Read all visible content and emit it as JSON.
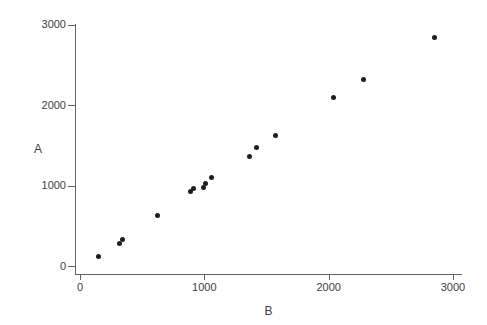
{
  "figure": {
    "background_color": "#ffffff",
    "axis_color": "#636363",
    "text_color": "#3d3d3d"
  },
  "chart_data": {
    "type": "scatter",
    "title": "",
    "xlabel": "B",
    "ylabel": "A",
    "xlim": [
      0,
      3000
    ],
    "ylim": [
      0,
      3000
    ],
    "x_ticks": [
      0,
      1000,
      2000,
      3000
    ],
    "y_ticks": [
      0,
      1000,
      2000,
      3000
    ],
    "grid": false,
    "legend_position": "none",
    "marker": {
      "shape": "filled-circle",
      "color": "#1e1e1e",
      "diameter_px": 5
    },
    "points": [
      {
        "B": 145,
        "A": 115
      },
      {
        "B": 315,
        "A": 275
      },
      {
        "B": 340,
        "A": 325
      },
      {
        "B": 620,
        "A": 630
      },
      {
        "B": 890,
        "A": 930
      },
      {
        "B": 915,
        "A": 965
      },
      {
        "B": 995,
        "A": 975
      },
      {
        "B": 1010,
        "A": 1020
      },
      {
        "B": 1060,
        "A": 1100
      },
      {
        "B": 1360,
        "A": 1355
      },
      {
        "B": 1420,
        "A": 1470
      },
      {
        "B": 1570,
        "A": 1620
      },
      {
        "B": 2040,
        "A": 2090
      },
      {
        "B": 2280,
        "A": 2315
      },
      {
        "B": 2850,
        "A": 2840
      }
    ]
  }
}
